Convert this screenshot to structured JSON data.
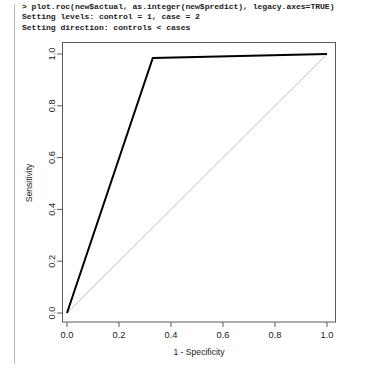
{
  "console": {
    "lines": [
      "> plot.roc(new$actual, as.integer(new$predict), legacy.axes=TRUE)",
      "Setting levels: control = 1, case = 2",
      "Setting direction: controls < cases"
    ]
  },
  "chart_data": {
    "type": "line",
    "title": "",
    "xlabel": "1 - Specificity",
    "ylabel": "Sensitivity",
    "xlim": [
      0,
      1
    ],
    "ylim": [
      0,
      1
    ],
    "grid": false,
    "legend": "none",
    "xticks": [
      "0.0",
      "0.2",
      "0.4",
      "0.6",
      "0.8",
      "1.0"
    ],
    "xtickvalues": [
      0.0,
      0.2,
      0.4,
      0.6,
      0.8,
      1.0
    ],
    "yticks": [
      "0.0",
      "0.2",
      "0.4",
      "0.6",
      "0.8",
      "1.0"
    ],
    "ytickvalues": [
      0.0,
      0.2,
      0.4,
      0.6,
      0.8,
      1.0
    ],
    "series": [
      {
        "name": "ROC curve",
        "color": "#000000",
        "linewidth": 2.0,
        "x": [
          0.0,
          0.33,
          1.0
        ],
        "y": [
          0.0,
          0.985,
          1.0
        ]
      },
      {
        "name": "chance diagonal",
        "color": "#b0b0b0",
        "linewidth": 0.8,
        "x": [
          0.0,
          1.0
        ],
        "y": [
          0.0,
          1.0
        ]
      }
    ]
  },
  "axes_geometry": {
    "x0_px": 67,
    "x1_px": 327,
    "y0_px": 313,
    "y1_px": 54,
    "frame_left_px": 62,
    "frame_right_px": 336,
    "frame_top_px": 42,
    "frame_bottom_px": 322
  }
}
